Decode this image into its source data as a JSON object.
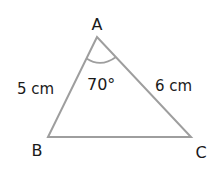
{
  "diagram": {
    "type": "triangle",
    "vertices": {
      "A": {
        "label": "A"
      },
      "B": {
        "label": "B"
      },
      "C": {
        "label": "C"
      }
    },
    "sides": {
      "AB": {
        "label": "5 cm"
      },
      "AC": {
        "label": "6 cm"
      }
    },
    "angle_A": {
      "label": "70°"
    },
    "colors": {
      "stroke": "#9e9e9e",
      "text": "#1a1a1a",
      "background": "#ffffff"
    }
  }
}
